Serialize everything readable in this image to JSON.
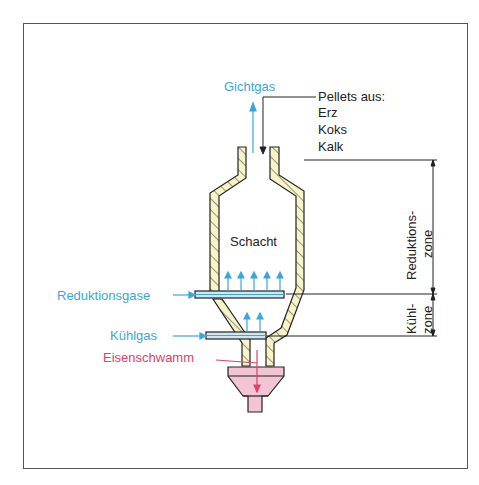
{
  "diagram": {
    "labels": {
      "top_gas": "Gichtgas",
      "feed_header": "Pellets aus:",
      "feed_items": [
        "Erz",
        "Koks",
        "Kalk"
      ],
      "shaft": "Schacht",
      "reduction_gas": "Reduktionsgase",
      "cooling_gas": "Kühlgas",
      "product": "Eisenschwamm",
      "zone_reduction_line1": "Reduktions-",
      "zone_reduction_line2": "zone",
      "zone_cooling_line1": "Kühl-",
      "zone_cooling_line2": "zone"
    },
    "colors": {
      "gas_blue": "#3aa7dc",
      "product_red": "#e0406a",
      "wall_fill": "#f7f4c8",
      "hopper_fill": "#f2c4d4",
      "pipe_fill": "#cfe6f3",
      "line": "#222222"
    }
  }
}
